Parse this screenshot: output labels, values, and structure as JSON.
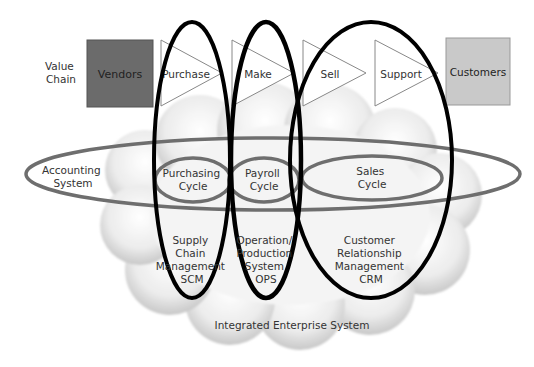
{
  "value_chain": {
    "label_line1": "Value",
    "label_line2": "Chain",
    "vendors": "Vendors",
    "customers": "Customers",
    "steps": [
      "Purchase",
      "Make",
      "Sell",
      "Support"
    ]
  },
  "accounting": {
    "label_line1": "Accounting",
    "label_line2": "System",
    "cycles": [
      {
        "line1": "Purchasing",
        "line2": "Cycle"
      },
      {
        "line1": "Payroll",
        "line2": "Cycle"
      },
      {
        "line1": "Sales",
        "line2": "Cycle"
      }
    ]
  },
  "systems": [
    {
      "lines": [
        "Supply",
        "Chain",
        "Management",
        "SCM"
      ]
    },
    {
      "lines": [
        "Operation/",
        "Production",
        "System",
        "OPS"
      ]
    },
    {
      "lines": [
        "Customer",
        "Relationship",
        "Management",
        "CRM"
      ]
    }
  ],
  "cloud_label": "Integrated Enterprise System",
  "colors": {
    "vendors_fill": "#6b6b6b",
    "customers_fill": "#c9c9c9",
    "accounting_ring": "#6e6e6e",
    "system_ring": "#000000"
  }
}
